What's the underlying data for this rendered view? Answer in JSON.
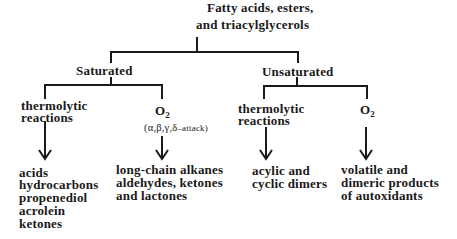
{
  "root": {
    "line1": "Fatty acids, esters,",
    "line2": "and triacylglycerols"
  },
  "branches": {
    "saturated": {
      "label": "Saturated",
      "thermolytic": {
        "label_line1": "thermolytic",
        "label_line2": "reactions",
        "products": [
          "acids",
          "hydrocarbons",
          "propenediol",
          "acrolein",
          "ketones"
        ]
      },
      "oxygen": {
        "label_main": "O",
        "label_sub": "2",
        "note_prefix": "(α,β,γ,δ",
        "note_attack": "–attack)",
        "products": [
          "long-chain alkanes",
          "aldehydes, ketones",
          "and lactones"
        ]
      }
    },
    "unsaturated": {
      "label": "Unsaturated",
      "thermolytic": {
        "label_line1": "thermolytic",
        "label_line2": "reactions",
        "products": [
          "acylic and",
          "cyclic dimers"
        ]
      },
      "oxygen": {
        "label_main": "O",
        "label_sub": "2",
        "products": [
          "volatile and",
          "dimeric products",
          "of autoxidants"
        ]
      }
    }
  },
  "colors": {
    "line": "#1a1a1a",
    "text": "#1a1a1a",
    "background": "#ffffff"
  }
}
